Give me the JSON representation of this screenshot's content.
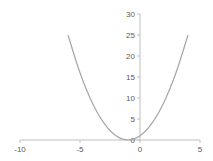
{
  "chart_data": {
    "type": "line",
    "title": "",
    "xlabel": "",
    "ylabel": "",
    "xlim": [
      -10,
      5
    ],
    "ylim": [
      0,
      30
    ],
    "x_ticks": [
      -10,
      -5,
      0,
      5
    ],
    "y_ticks": [
      0,
      5,
      10,
      15,
      20,
      25,
      30
    ],
    "grid": false,
    "legend": null,
    "series": [
      {
        "name": "y = (x+1)^2",
        "color": "#a6a6a6",
        "x": [
          -6,
          -5,
          -4,
          -3,
          -2,
          -1,
          0,
          1,
          2,
          3,
          4
        ],
        "y": [
          25,
          16,
          9,
          4,
          1,
          0,
          1,
          4,
          9,
          16,
          25
        ]
      }
    ]
  },
  "axis_color": "#bfbfbf",
  "label_color": "#595959"
}
